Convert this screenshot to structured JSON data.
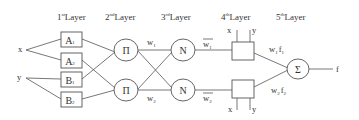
{
  "diagram": {
    "type": "ANFIS architecture",
    "layers": [
      {
        "num": "1",
        "sup": "st",
        "label": "Layer"
      },
      {
        "num": "2",
        "sup": "nd",
        "label": "Layer"
      },
      {
        "num": "3",
        "sup": "rd",
        "label": "Layer"
      },
      {
        "num": "4",
        "sup": "th",
        "label": "Layer"
      },
      {
        "num": "5",
        "sup": "th",
        "label": "Layer"
      }
    ],
    "inputs": {
      "x": "x",
      "y": "y"
    },
    "layer1_nodes": [
      {
        "base": "A",
        "sub": "1"
      },
      {
        "base": "A",
        "sub": "2"
      },
      {
        "base": "B",
        "sub": "1"
      },
      {
        "base": "B",
        "sub": "2"
      }
    ],
    "layer2_nodes": [
      "Π",
      "Π"
    ],
    "layer2_outputs": [
      {
        "base": "w",
        "sub": "1"
      },
      {
        "base": "w",
        "sub": "2"
      }
    ],
    "layer3_nodes": [
      "N",
      "N"
    ],
    "layer3_outputs": [
      {
        "base": "w",
        "sub": "1",
        "bar": true
      },
      {
        "base": "w",
        "sub": "2",
        "bar": true
      }
    ],
    "layer4_inputs": {
      "x": "x",
      "y": "y"
    },
    "layer4_outputs": [
      {
        "w": "w",
        "wsub": "1",
        "f": "f",
        "fsub": "1"
      },
      {
        "w": "w",
        "wsub": "2",
        "f": "f",
        "fsub": "2"
      }
    ],
    "layer5_node": "Σ",
    "output": "f"
  }
}
